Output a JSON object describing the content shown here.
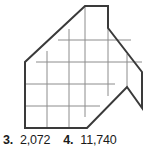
{
  "figure": {
    "name": "grid-polygon-house-arrow",
    "grid": {
      "cell_size": 22,
      "line_color": "#8c8c8c",
      "line_width": 1
    },
    "outline": {
      "color": "#3a3a3a",
      "line_width": 2,
      "points": "85,6 108,6 108,28 142,72 142,108 127,87 87,128 25,128 25,62"
    },
    "interior_grid_lines": [
      {
        "x1": 25,
        "y1": 84,
        "x2": 115,
        "y2": 84
      },
      {
        "x1": 25,
        "y1": 106,
        "x2": 100,
        "y2": 106
      },
      {
        "x1": 36,
        "y1": 62,
        "x2": 142,
        "y2": 62
      },
      {
        "x1": 58,
        "y1": 40,
        "x2": 131,
        "y2": 40
      },
      {
        "x1": 47,
        "y1": 128,
        "x2": 47,
        "y2": 51
      },
      {
        "x1": 69,
        "y1": 128,
        "x2": 69,
        "y2": 29
      },
      {
        "x1": 85,
        "y1": 117,
        "x2": 85,
        "y2": 6
      },
      {
        "x1": 108,
        "y1": 96,
        "x2": 108,
        "y2": 28
      },
      {
        "x1": 127,
        "y1": 87,
        "x2": 127,
        "y2": 54
      }
    ]
  },
  "answers": {
    "items": [
      {
        "number": "3.",
        "value": "2,072"
      },
      {
        "number": "4.",
        "value": "11,740"
      }
    ]
  },
  "colors": {
    "background": "#ffffff",
    "outline": "#3a3a3a",
    "gridline": "#8c8c8c",
    "text": "#1a1a1a"
  }
}
